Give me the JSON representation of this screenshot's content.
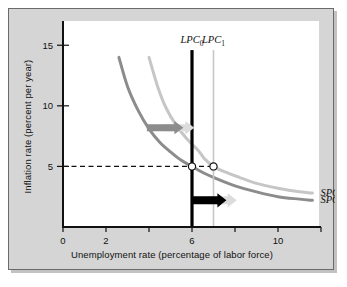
{
  "chart_data": {
    "type": "line",
    "title": "",
    "xlabel": "Unemployment rate (percentage of labor force)",
    "ylabel": "Inflation rate (percent per year)",
    "xlim": [
      0,
      12
    ],
    "ylim": [
      0,
      17
    ],
    "grid": false,
    "legend_position": "inline-right",
    "xticks": [
      0,
      2,
      4,
      6,
      8,
      10,
      12
    ],
    "xticklabels": [
      "0",
      "2",
      "",
      "6",
      "",
      "10",
      ""
    ],
    "yticks": [
      5,
      10,
      15
    ],
    "yticklabels": [
      "5",
      "10",
      "15"
    ],
    "series": [
      {
        "name": "SPC_0",
        "label": "SPC",
        "label_sub": "0",
        "color": "#8c8c8c",
        "type": "short-run-phillips-curve",
        "points": [
          {
            "x": 2.6,
            "y": 14.0
          },
          {
            "x": 3.0,
            "y": 11.6
          },
          {
            "x": 3.5,
            "y": 9.6
          },
          {
            "x": 4.0,
            "y": 8.1
          },
          {
            "x": 4.5,
            "y": 7.0
          },
          {
            "x": 5.0,
            "y": 6.2
          },
          {
            "x": 5.5,
            "y": 5.5
          },
          {
            "x": 6.0,
            "y": 5.0
          },
          {
            "x": 6.5,
            "y": 4.5
          },
          {
            "x": 7.0,
            "y": 4.1
          },
          {
            "x": 8.0,
            "y": 3.4
          },
          {
            "x": 9.0,
            "y": 2.9
          },
          {
            "x": 10.0,
            "y": 2.5
          },
          {
            "x": 11.0,
            "y": 2.3
          },
          {
            "x": 11.6,
            "y": 2.2
          }
        ]
      },
      {
        "name": "SPC_1",
        "label": "SPC",
        "label_sub": "1",
        "color": "#c6c6c6",
        "type": "short-run-phillips-curve",
        "points": [
          {
            "x": 4.0,
            "y": 14.0
          },
          {
            "x": 4.4,
            "y": 11.6
          },
          {
            "x": 4.8,
            "y": 9.8
          },
          {
            "x": 5.3,
            "y": 8.3
          },
          {
            "x": 5.8,
            "y": 7.2
          },
          {
            "x": 6.3,
            "y": 6.3
          },
          {
            "x": 6.6,
            "y": 5.6
          },
          {
            "x": 7.0,
            "y": 5.0
          },
          {
            "x": 7.6,
            "y": 4.5
          },
          {
            "x": 8.2,
            "y": 4.1
          },
          {
            "x": 9.0,
            "y": 3.6
          },
          {
            "x": 10.0,
            "y": 3.2
          },
          {
            "x": 11.0,
            "y": 2.9
          },
          {
            "x": 11.6,
            "y": 2.8
          }
        ]
      }
    ],
    "vertical_lines": [
      {
        "name": "LPC_0",
        "label": "LPC",
        "label_sub": "0",
        "x": 6,
        "color": "#000000",
        "width": 3.2
      },
      {
        "name": "LPC_1",
        "label": "LPC",
        "label_sub": "1",
        "x": 7,
        "color": "#c6c6c6",
        "width": 1.6
      }
    ],
    "markers": [
      {
        "name": "equilibrium-0",
        "x": 6,
        "y": 5
      },
      {
        "name": "equilibrium-1",
        "x": 7,
        "y": 5
      }
    ],
    "reference_lines": [
      {
        "name": "inflation-5-dashed",
        "y": 5,
        "x_from": 0,
        "x_to": 7,
        "style": "dashed",
        "color": "#111111"
      }
    ],
    "arrows": [
      {
        "name": "curve-shift-arrow",
        "color": "#8c8c8c",
        "ghost_color": "#dcdcdc",
        "x_from": 3.9,
        "x_to": 5.6,
        "y": 8.2
      },
      {
        "name": "natural-rate-shift-arrow",
        "color": "#000000",
        "ghost_color": "#dcdcdc",
        "x_from": 6.0,
        "x_to": 7.6,
        "y": 2.2
      }
    ]
  }
}
